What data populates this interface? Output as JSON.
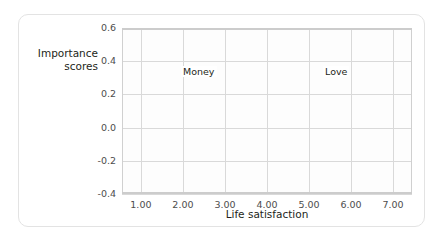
{
  "chart_data": {
    "type": "line",
    "title": "",
    "xlabel": "Life satisfaction",
    "ylabel": "Importance scores",
    "ylabel_lines": [
      "Importance",
      "scores"
    ],
    "x": [
      1.0,
      2.0,
      3.0,
      4.0,
      5.0,
      6.0,
      7.0
    ],
    "xtick_labels": [
      "1.00",
      "2.00",
      "3.00",
      "4.00",
      "5.00",
      "6.00",
      "7.00"
    ],
    "ytick_labels": [
      "0.6",
      "0.4",
      "0.2",
      "0.0",
      "-0.2",
      "-0.4"
    ],
    "ylim": [
      -0.4,
      0.6
    ],
    "xlim": [
      0.55,
      7.45
    ],
    "grid": true,
    "legend": "inline-labels",
    "series": [
      {
        "name": "Money",
        "label": "Money",
        "color": "#c8c8c8",
        "values": [
          0.38,
          0.3,
          0.19,
          0.0,
          -0.08,
          -0.11,
          -0.25
        ]
      },
      {
        "name": "Love",
        "label": "Love",
        "color": "#c8c8c8",
        "values": [
          -0.17,
          -0.18,
          -0.13,
          -0.06,
          0.11,
          0.24,
          0.42
        ]
      }
    ]
  },
  "colors": {
    "line": "#c8c8c8",
    "grid": "#d9d9d9",
    "axis_text": "#4d4d4d",
    "label_text": "#231f20",
    "card_border": "#e3e3e3",
    "background": "#ffffff"
  }
}
